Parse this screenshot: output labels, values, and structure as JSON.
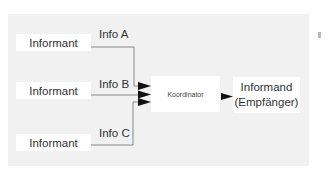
{
  "diagram": {
    "informants": [
      {
        "label": "Informant",
        "info": "Info A"
      },
      {
        "label": "Informant",
        "info": "Info B"
      },
      {
        "label": "Informant",
        "info": "Info C"
      }
    ],
    "coordinator": {
      "label": "Koordinator"
    },
    "recipient": {
      "line1": "Informand",
      "line2": "(Empfänger)"
    },
    "colors": {
      "panel": "#f1f1f1",
      "box": "#ffffff",
      "line": "#888888",
      "arrow": "#111111"
    }
  }
}
